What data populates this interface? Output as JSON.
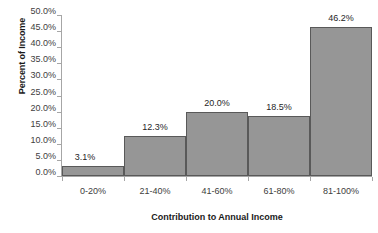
{
  "chart_data": {
    "type": "bar",
    "title": "",
    "subtitle": "",
    "xlabel": "Contribution to Annual Income",
    "ylabel": "Percent of Income",
    "categories": [
      "0-20%",
      "21-40%",
      "41-60%",
      "61-80%",
      "81-100%"
    ],
    "values": [
      3.1,
      12.3,
      20.0,
      18.5,
      46.2
    ],
    "data_labels": [
      "3.1%",
      "12.3%",
      "20.0%",
      "18.5%",
      "46.2%"
    ],
    "ylim": [
      0,
      50
    ],
    "ytick_step": 5,
    "ytick_labels": [
      "50.0%",
      "45.0%",
      "40.0%",
      "35.0%",
      "30.0%",
      "25.0%",
      "20.0%",
      "15.0%",
      "10.0%",
      "5.0%",
      "0.0%"
    ],
    "ytick_values": [
      50,
      45,
      40,
      35,
      30,
      25,
      20,
      15,
      10,
      5,
      0
    ],
    "grid": false,
    "legend": false,
    "legend_position": "none",
    "bar_gap": 0,
    "colors": {
      "bar_fill": "#969696",
      "bar_border": "#595959",
      "axis_line": "#a6a6a6",
      "tick_text": "#404040",
      "title_text": "#1a1a1a",
      "data_label_text": "#262626",
      "background": "#ffffff"
    }
  }
}
